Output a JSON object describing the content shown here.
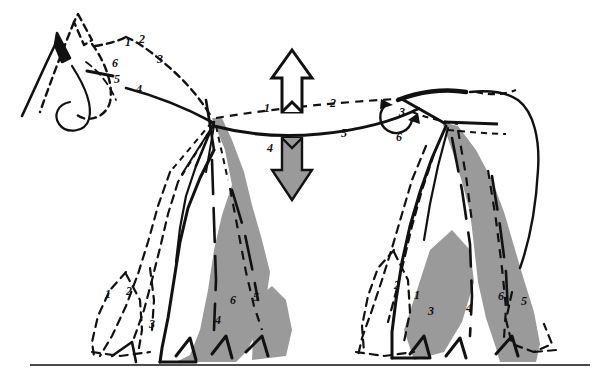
{
  "figure": {
    "background_color": "#ffffff",
    "ink_color": "#111111",
    "fill_gray": "#9a9a9a",
    "width": 595,
    "height": 381
  },
  "ground": {
    "label": "ground-line",
    "y": 365,
    "x_start": 30,
    "x_end": 590
  },
  "arrows": {
    "up": {
      "name": "up-arrow",
      "style": "outline-white",
      "x": 292,
      "y_top": 52,
      "y_bottom": 110
    },
    "down": {
      "name": "down-arrow",
      "style": "filled-gray",
      "x": 292,
      "y_top": 140,
      "y_bottom": 198
    }
  },
  "labels": {
    "head": [
      {
        "text": "1",
        "x": 125,
        "y": 36
      },
      {
        "text": "2",
        "x": 139,
        "y": 33
      },
      {
        "text": "3",
        "x": 157,
        "y": 53
      },
      {
        "text": "4",
        "x": 136,
        "y": 83
      },
      {
        "text": "5",
        "x": 114,
        "y": 73
      },
      {
        "text": "6",
        "x": 112,
        "y": 57
      }
    ],
    "back": [
      {
        "text": "1",
        "x": 264,
        "y": 102
      },
      {
        "text": "2",
        "x": 330,
        "y": 97
      },
      {
        "text": "4",
        "x": 267,
        "y": 142
      },
      {
        "text": "5",
        "x": 341,
        "y": 127
      }
    ],
    "croup_angle": [
      {
        "text": "3",
        "x": 399,
        "y": 106
      },
      {
        "text": "6",
        "x": 396,
        "y": 131
      }
    ],
    "left_limb": [
      {
        "text": "1",
        "x": 105,
        "y": 288
      },
      {
        "text": "2",
        "x": 126,
        "y": 285
      },
      {
        "text": "3",
        "x": 149,
        "y": 318
      },
      {
        "text": "4",
        "x": 215,
        "y": 314
      },
      {
        "text": "5",
        "x": 253,
        "y": 291
      },
      {
        "text": "6",
        "x": 230,
        "y": 294
      }
    ],
    "right_limb": [
      {
        "text": "2",
        "x": 394,
        "y": 279
      },
      {
        "text": "1",
        "x": 414,
        "y": 289
      },
      {
        "text": "3",
        "x": 428,
        "y": 305
      },
      {
        "text": "4",
        "x": 466,
        "y": 302
      },
      {
        "text": "6",
        "x": 498,
        "y": 290
      },
      {
        "text": "5",
        "x": 521,
        "y": 295
      }
    ]
  },
  "legend_note": {
    "solid_line": "current posture outline",
    "dashed_line": "alternate posture outline",
    "gray_fill": "limb mass"
  }
}
